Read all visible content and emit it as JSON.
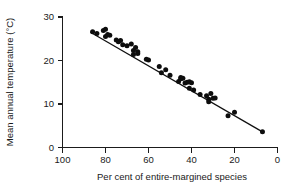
{
  "chart_data": {
    "type": "scatter",
    "title": "",
    "xlabel": "Per cent of entire-margined species",
    "ylabel": "Mean annual temperature (°C)",
    "xlim": [
      100,
      0
    ],
    "ylim": [
      0,
      30
    ],
    "x_ticks": [
      100,
      80,
      60,
      40,
      20,
      0
    ],
    "y_ticks": [
      0,
      10,
      20,
      30
    ],
    "x_axis_reversed": true,
    "grid": false,
    "legend": null,
    "marker": "filled-circle",
    "points": [
      {
        "x": 86,
        "y": 26.6
      },
      {
        "x": 84,
        "y": 26.2
      },
      {
        "x": 81,
        "y": 26.9
      },
      {
        "x": 80,
        "y": 25.5
      },
      {
        "x": 80,
        "y": 27.2
      },
      {
        "x": 79,
        "y": 26.0
      },
      {
        "x": 78,
        "y": 25.8
      },
      {
        "x": 75,
        "y": 24.7
      },
      {
        "x": 74,
        "y": 24.3
      },
      {
        "x": 73,
        "y": 24.6
      },
      {
        "x": 72,
        "y": 23.6
      },
      {
        "x": 70,
        "y": 23.4
      },
      {
        "x": 68,
        "y": 23.8
      },
      {
        "x": 67,
        "y": 22.3
      },
      {
        "x": 67,
        "y": 21.4
      },
      {
        "x": 66,
        "y": 23.0
      },
      {
        "x": 65,
        "y": 22.0
      },
      {
        "x": 65,
        "y": 21.6
      },
      {
        "x": 61,
        "y": 20.3
      },
      {
        "x": 60,
        "y": 20.1
      },
      {
        "x": 55,
        "y": 18.6
      },
      {
        "x": 54,
        "y": 17.2
      },
      {
        "x": 52,
        "y": 17.9
      },
      {
        "x": 50,
        "y": 16.6
      },
      {
        "x": 46,
        "y": 15.2
      },
      {
        "x": 45,
        "y": 16.1
      },
      {
        "x": 45,
        "y": 15.8
      },
      {
        "x": 44,
        "y": 15.9
      },
      {
        "x": 43,
        "y": 14.8
      },
      {
        "x": 42,
        "y": 15.0
      },
      {
        "x": 41,
        "y": 13.6
      },
      {
        "x": 41,
        "y": 15.1
      },
      {
        "x": 40,
        "y": 14.9
      },
      {
        "x": 39,
        "y": 13.2
      },
      {
        "x": 36,
        "y": 12.2
      },
      {
        "x": 33,
        "y": 11.9
      },
      {
        "x": 32,
        "y": 11.1
      },
      {
        "x": 32,
        "y": 10.5
      },
      {
        "x": 31,
        "y": 12.4
      },
      {
        "x": 30,
        "y": 11.3
      },
      {
        "x": 29,
        "y": 11.4
      },
      {
        "x": 23,
        "y": 7.3
      },
      {
        "x": 20,
        "y": 8.1
      },
      {
        "x": 7,
        "y": 3.6
      }
    ],
    "trend_line": {
      "x1": 87,
      "y1": 26.5,
      "x2": 7,
      "y2": 3.6
    }
  }
}
